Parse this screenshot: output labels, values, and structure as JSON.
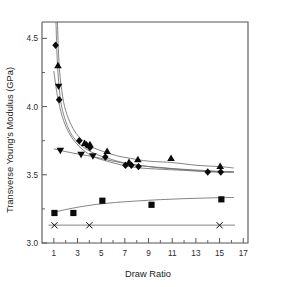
{
  "chart_data": {
    "type": "scatter",
    "title": "",
    "xlabel": "Draw Ratio",
    "ylabel": "Transverse Young's Modulus (GPa)",
    "xlim": [
      0,
      17.4
    ],
    "ylim": [
      3.0,
      4.62
    ],
    "xticks": [
      1,
      3,
      5,
      7,
      9,
      11,
      13,
      15,
      17
    ],
    "xticklabels": [
      "1",
      "3",
      "5",
      "7",
      "9",
      "11",
      "13",
      "15",
      "17"
    ],
    "yticks": [
      3.0,
      3.5,
      4.0,
      4.5
    ],
    "yticklabels": [
      "3.0",
      "3.5",
      "4.0",
      "4.5"
    ],
    "yminorticks": [
      3.25,
      3.75,
      4.25
    ],
    "grid": false,
    "legend": "none",
    "series": [
      {
        "name": "diamond-series",
        "marker": "diamond",
        "points": [
          {
            "x": 1.15,
            "y": 4.45
          },
          {
            "x": 1.45,
            "y": 4.05
          },
          {
            "x": 3.15,
            "y": 3.75
          },
          {
            "x": 3.75,
            "y": 3.72
          },
          {
            "x": 4.05,
            "y": 3.7
          },
          {
            "x": 5.35,
            "y": 3.63
          },
          {
            "x": 7.05,
            "y": 3.57
          },
          {
            "x": 7.55,
            "y": 3.57
          },
          {
            "x": 8.15,
            "y": 3.56
          },
          {
            "x": 14.0,
            "y": 3.52
          },
          {
            "x": 15.1,
            "y": 3.52
          }
        ]
      },
      {
        "name": "up-triangle-series",
        "marker": "triangle-up",
        "points": [
          {
            "x": 1.35,
            "y": 4.3
          },
          {
            "x": 3.6,
            "y": 3.73
          },
          {
            "x": 4.05,
            "y": 3.72
          },
          {
            "x": 5.5,
            "y": 3.67
          },
          {
            "x": 7.35,
            "y": 3.59
          },
          {
            "x": 8.1,
            "y": 3.61
          },
          {
            "x": 10.9,
            "y": 3.62
          },
          {
            "x": 15.05,
            "y": 3.56
          }
        ]
      },
      {
        "name": "down-triangle-series",
        "marker": "triangle-down",
        "points": [
          {
            "x": 1.4,
            "y": 4.15
          },
          {
            "x": 1.55,
            "y": 3.68
          },
          {
            "x": 3.3,
            "y": 3.65
          },
          {
            "x": 4.3,
            "y": 3.64
          }
        ]
      },
      {
        "name": "square-series",
        "marker": "square",
        "points": [
          {
            "x": 1.05,
            "y": 3.22
          },
          {
            "x": 2.65,
            "y": 3.22
          },
          {
            "x": 5.1,
            "y": 3.31
          },
          {
            "x": 9.25,
            "y": 3.28
          },
          {
            "x": 15.15,
            "y": 3.32
          }
        ]
      },
      {
        "name": "cross-series",
        "marker": "x",
        "points": [
          {
            "x": 1.05,
            "y": 3.13
          },
          {
            "x": 4.0,
            "y": 3.13
          },
          {
            "x": 15.0,
            "y": 3.13
          }
        ]
      }
    ],
    "fit_curves": [
      {
        "name": "upper-decay-fit",
        "description": "decay curve through up-triangle data",
        "points": [
          {
            "x": 1.3,
            "y": 4.62
          },
          {
            "x": 1.45,
            "y": 4.3
          },
          {
            "x": 1.7,
            "y": 4.1
          },
          {
            "x": 2.0,
            "y": 3.97
          },
          {
            "x": 2.5,
            "y": 3.86
          },
          {
            "x": 3.0,
            "y": 3.79
          },
          {
            "x": 3.6,
            "y": 3.74
          },
          {
            "x": 4.3,
            "y": 3.7
          },
          {
            "x": 5.2,
            "y": 3.67
          },
          {
            "x": 6.3,
            "y": 3.64
          },
          {
            "x": 7.5,
            "y": 3.62
          },
          {
            "x": 9.0,
            "y": 3.6
          },
          {
            "x": 11.0,
            "y": 3.59
          },
          {
            "x": 13.0,
            "y": 3.57
          },
          {
            "x": 15.0,
            "y": 3.56
          },
          {
            "x": 16.2,
            "y": 3.55
          }
        ]
      },
      {
        "name": "middle-decay-fit",
        "description": "decay curve through diamond data",
        "points": [
          {
            "x": 1.18,
            "y": 4.62
          },
          {
            "x": 1.3,
            "y": 4.32
          },
          {
            "x": 1.55,
            "y": 4.06
          },
          {
            "x": 1.9,
            "y": 3.92
          },
          {
            "x": 2.4,
            "y": 3.81
          },
          {
            "x": 3.0,
            "y": 3.74
          },
          {
            "x": 3.7,
            "y": 3.69
          },
          {
            "x": 4.6,
            "y": 3.65
          },
          {
            "x": 5.6,
            "y": 3.62
          },
          {
            "x": 6.8,
            "y": 3.59
          },
          {
            "x": 8.2,
            "y": 3.57
          },
          {
            "x": 10.0,
            "y": 3.55
          },
          {
            "x": 12.0,
            "y": 3.54
          },
          {
            "x": 14.0,
            "y": 3.53
          },
          {
            "x": 16.2,
            "y": 3.52
          }
        ]
      },
      {
        "name": "lower-decay-fit",
        "description": "decay curve starting near 4.25",
        "points": [
          {
            "x": 1.0,
            "y": 4.26
          },
          {
            "x": 1.3,
            "y": 4.08
          },
          {
            "x": 1.7,
            "y": 3.93
          },
          {
            "x": 2.2,
            "y": 3.82
          },
          {
            "x": 2.8,
            "y": 3.74
          },
          {
            "x": 3.5,
            "y": 3.68
          },
          {
            "x": 4.4,
            "y": 3.63
          },
          {
            "x": 5.5,
            "y": 3.6
          },
          {
            "x": 6.8,
            "y": 3.57
          },
          {
            "x": 8.3,
            "y": 3.55
          },
          {
            "x": 10.2,
            "y": 3.54
          },
          {
            "x": 12.5,
            "y": 3.53
          },
          {
            "x": 14.5,
            "y": 3.52
          },
          {
            "x": 16.2,
            "y": 3.52
          }
        ]
      },
      {
        "name": "flat-decay-fit",
        "description": "gently falling line through down-triangle data",
        "points": [
          {
            "x": 1.0,
            "y": 3.69
          },
          {
            "x": 2.0,
            "y": 3.67
          },
          {
            "x": 3.2,
            "y": 3.65
          },
          {
            "x": 4.5,
            "y": 3.63
          },
          {
            "x": 6.0,
            "y": 3.6
          },
          {
            "x": 8.0,
            "y": 3.57
          },
          {
            "x": 10.5,
            "y": 3.55
          },
          {
            "x": 13.0,
            "y": 3.53
          },
          {
            "x": 16.2,
            "y": 3.52
          }
        ]
      },
      {
        "name": "rising-fit",
        "description": "gently rising curve through square data",
        "points": [
          {
            "x": 1.0,
            "y": 3.225
          },
          {
            "x": 2.0,
            "y": 3.245
          },
          {
            "x": 3.2,
            "y": 3.265
          },
          {
            "x": 4.6,
            "y": 3.283
          },
          {
            "x": 6.2,
            "y": 3.297
          },
          {
            "x": 8.0,
            "y": 3.308
          },
          {
            "x": 10.0,
            "y": 3.318
          },
          {
            "x": 12.0,
            "y": 3.325
          },
          {
            "x": 14.0,
            "y": 3.33
          },
          {
            "x": 16.2,
            "y": 3.334
          }
        ]
      },
      {
        "name": "baseline-flat-fit",
        "description": "flat horizontal line through cross markers",
        "points": [
          {
            "x": 0.55,
            "y": 3.131
          },
          {
            "x": 16.3,
            "y": 3.131
          }
        ]
      }
    ]
  }
}
